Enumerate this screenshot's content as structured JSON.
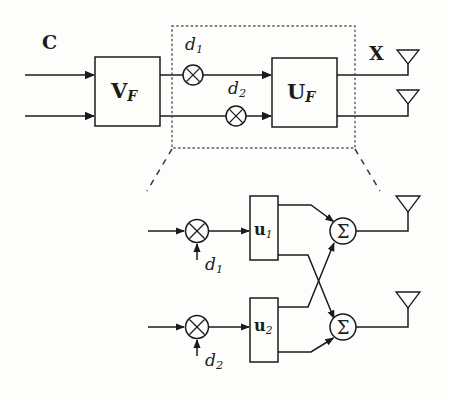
{
  "figure": {
    "type": "block-diagram",
    "background_color": "#fdfdfb",
    "line_color": "#1b1b1b"
  },
  "top_stage": {
    "input_label": "C",
    "output_label": "X",
    "precoder_block": {
      "symbol": "V",
      "subscript": "F"
    },
    "beamformer_block": {
      "symbol": "U",
      "subscript": "F"
    },
    "multipliers": [
      {
        "name": "mixer-1",
        "glyph": "✕",
        "stream_label": "d",
        "stream_subscript": "1"
      },
      {
        "name": "mixer-2",
        "glyph": "✕",
        "stream_label": "d",
        "stream_subscript": "2"
      }
    ],
    "antenna_count": 2,
    "input_count": 2
  },
  "detail_stage": {
    "caption": "",
    "branches": [
      {
        "mixer_glyph": "✕",
        "stream_label": "d",
        "stream_subscript": "1",
        "weight_symbol": "u",
        "weight_subscript": "1",
        "adder_glyph": "Σ"
      },
      {
        "mixer_glyph": "✕",
        "stream_label": "d",
        "stream_subscript": "2",
        "weight_symbol": "u",
        "weight_subscript": "2",
        "adder_glyph": "Σ"
      }
    ],
    "antenna_count": 2
  }
}
